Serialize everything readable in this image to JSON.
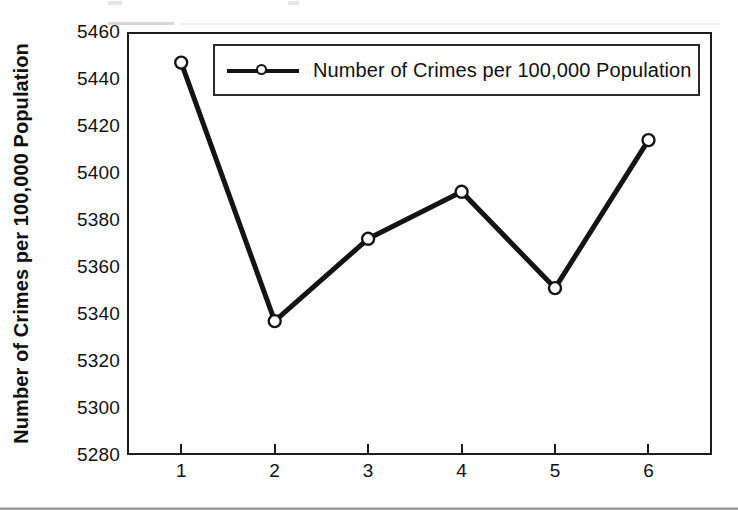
{
  "figure": {
    "background_color": "#ffffff",
    "frame_color": "#1c1c1c",
    "has_bottom_rule": true
  },
  "legend": {
    "entries": [
      {
        "label": "Number of Crimes per 100,000 Population",
        "marker": "open-circle",
        "line_color": "#141414"
      }
    ],
    "position": "inside-top-center",
    "border_color": "#2a2a2a"
  },
  "axes": {
    "y_title": "Number of Crimes per 100,000 Population",
    "x_title": "",
    "y_ticks": [
      "5280",
      "5300",
      "5320",
      "5340",
      "5360",
      "5380",
      "5400",
      "5420",
      "5440",
      "5460"
    ],
    "x_ticks": [
      "1",
      "2",
      "3",
      "4",
      "5",
      "6"
    ]
  },
  "chart_data": {
    "type": "line",
    "title": "",
    "subtitle": "",
    "xlabel": "",
    "ylabel": "Number of Crimes per 100,000 Population",
    "categories": [
      "1",
      "2",
      "3",
      "4",
      "5",
      "6"
    ],
    "x": [
      1,
      2,
      3,
      4,
      5,
      6
    ],
    "series": [
      {
        "name": "Number of Crimes per 100,000 Population",
        "values": [
          5447,
          5337,
          5372,
          5392,
          5351,
          5414
        ],
        "color": "#141414",
        "marker": "open-circle",
        "line_width": 5
      }
    ],
    "ylim": [
      5280,
      5460
    ],
    "ytick_step": 20,
    "xlim": [
      0.42,
      6.68
    ],
    "grid": false,
    "legend_position": "inside-top-center"
  }
}
